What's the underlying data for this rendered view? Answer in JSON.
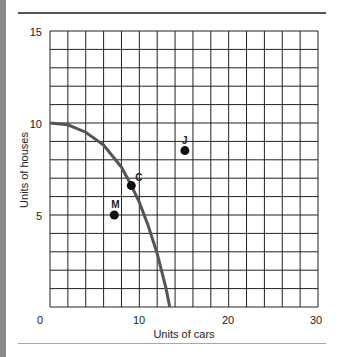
{
  "chart_data": {
    "type": "line",
    "title": "",
    "xlabel": "Units of cars",
    "ylabel": "Units of houses",
    "xlim": [
      0,
      30
    ],
    "ylim": [
      0,
      15
    ],
    "x_ticks": [
      0,
      10,
      20,
      30
    ],
    "y_ticks": [
      5,
      10,
      15
    ],
    "grid": true,
    "grid_step": {
      "x": 2,
      "y": 1
    },
    "series": [
      {
        "name": "Production possibilities frontier",
        "type": "line",
        "color": "#555555",
        "points": [
          [
            0,
            10
          ],
          [
            2,
            9.9
          ],
          [
            4,
            9.5
          ],
          [
            6,
            8.8
          ],
          [
            8,
            7.6
          ],
          [
            9,
            6.7
          ],
          [
            10,
            5.7
          ],
          [
            11,
            4.4
          ],
          [
            12,
            2.9
          ],
          [
            13,
            1.0
          ],
          [
            13.4,
            0
          ]
        ]
      },
      {
        "name": "Points",
        "type": "scatter",
        "color": "#111111",
        "points": [
          {
            "label": "C",
            "x": 9.1,
            "y": 6.6
          },
          {
            "label": "M",
            "x": 7.2,
            "y": 5.0
          },
          {
            "label": "J",
            "x": 15.1,
            "y": 8.5
          }
        ]
      }
    ]
  },
  "axes": {
    "xlabel": "Units of cars",
    "ylabel": "Units of houses",
    "x_tick_labels": [
      "0",
      "10",
      "20",
      "30"
    ],
    "y_tick_labels": [
      "5",
      "10",
      "15"
    ]
  },
  "points": {
    "c": "C",
    "m": "M",
    "j": "J"
  }
}
